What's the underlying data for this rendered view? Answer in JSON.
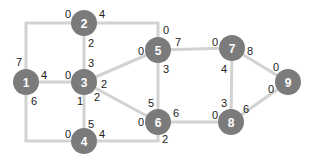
{
  "graph": {
    "nodes": [
      {
        "id": "1",
        "label": "1",
        "x": 26,
        "y": 82
      },
      {
        "id": "2",
        "label": "2",
        "x": 84,
        "y": 23
      },
      {
        "id": "3",
        "label": "3",
        "x": 84,
        "y": 82
      },
      {
        "id": "4",
        "label": "4",
        "x": 84,
        "y": 141
      },
      {
        "id": "5",
        "label": "5",
        "x": 158,
        "y": 50
      },
      {
        "id": "6",
        "label": "6",
        "x": 158,
        "y": 122
      },
      {
        "id": "7",
        "label": "7",
        "x": 232,
        "y": 48
      },
      {
        "id": "8",
        "label": "8",
        "x": 231,
        "y": 122
      },
      {
        "id": "9",
        "label": "9",
        "x": 288,
        "y": 82
      }
    ],
    "edges": [
      {
        "from": "1",
        "to": "2",
        "points": "26,82 26,23 84,23"
      },
      {
        "from": "1",
        "to": "3",
        "points": "26,82 84,82"
      },
      {
        "from": "1",
        "to": "4",
        "points": "26,82 26,141 84,141"
      },
      {
        "from": "2",
        "to": "3",
        "points": "84,23 84,82"
      },
      {
        "from": "2",
        "to": "5",
        "points": "84,23 158,23 158,50"
      },
      {
        "from": "3",
        "to": "4",
        "points": "84,82 84,141"
      },
      {
        "from": "3",
        "to": "5",
        "points": "84,82 158,50"
      },
      {
        "from": "3",
        "to": "6",
        "points": "84,82 158,122"
      },
      {
        "from": "4",
        "to": "6",
        "points": "84,141 158,141 158,122"
      },
      {
        "from": "5",
        "to": "6",
        "points": "158,50 158,122"
      },
      {
        "from": "5",
        "to": "7",
        "points": "158,50 232,48"
      },
      {
        "from": "6",
        "to": "8",
        "points": "158,122 231,122"
      },
      {
        "from": "7",
        "to": "8",
        "points": "232,48 231,122"
      },
      {
        "from": "7",
        "to": "9",
        "points": "232,48 288,82"
      },
      {
        "from": "8",
        "to": "9",
        "points": "231,122 288,82"
      }
    ],
    "port_labels": [
      {
        "text": "7",
        "x": 19,
        "y": 62
      },
      {
        "text": "4",
        "x": 44,
        "y": 75
      },
      {
        "text": "6",
        "x": 34,
        "y": 101
      },
      {
        "text": "0",
        "x": 68,
        "y": 14
      },
      {
        "text": "4",
        "x": 102,
        "y": 14
      },
      {
        "text": "2",
        "x": 91,
        "y": 43
      },
      {
        "text": "3",
        "x": 91,
        "y": 63
      },
      {
        "text": "0",
        "x": 68,
        "y": 75
      },
      {
        "text": "2",
        "x": 104,
        "y": 84
      },
      {
        "text": "2",
        "x": 97,
        "y": 97
      },
      {
        "text": "1",
        "x": 80,
        "y": 101
      },
      {
        "text": "5",
        "x": 91,
        "y": 124
      },
      {
        "text": "0",
        "x": 68,
        "y": 134
      },
      {
        "text": "4",
        "x": 102,
        "y": 134
      },
      {
        "text": "0",
        "x": 166,
        "y": 30
      },
      {
        "text": "0",
        "x": 141,
        "y": 51
      },
      {
        "text": "7",
        "x": 178,
        "y": 42
      },
      {
        "text": "3",
        "x": 166,
        "y": 69
      },
      {
        "text": "5",
        "x": 151,
        "y": 103
      },
      {
        "text": "0",
        "x": 141,
        "y": 122
      },
      {
        "text": "6",
        "x": 176,
        "y": 113
      },
      {
        "text": "2",
        "x": 165,
        "y": 139
      },
      {
        "text": "0",
        "x": 215,
        "y": 42
      },
      {
        "text": "8",
        "x": 250,
        "y": 51
      },
      {
        "text": "4",
        "x": 224,
        "y": 69
      },
      {
        "text": "3",
        "x": 224,
        "y": 103
      },
      {
        "text": "0",
        "x": 215,
        "y": 115
      },
      {
        "text": "6",
        "x": 246,
        "y": 109
      },
      {
        "text": "0",
        "x": 276,
        "y": 67
      },
      {
        "text": "0",
        "x": 271,
        "y": 89
      }
    ]
  }
}
